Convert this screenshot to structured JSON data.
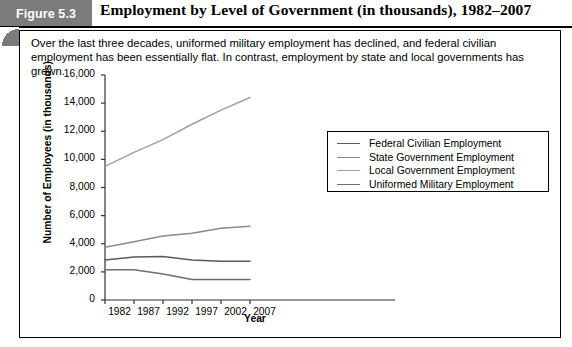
{
  "figure": {
    "tab_label": "Figure 5.3",
    "title": "Employment by Level of Government (in thousands), 1982–2007",
    "caption": "Over the last three decades, uniformed military employment has declined, and federal civilian employment has been essentially flat. In contrast, employment by state and local governments has grown."
  },
  "colors": {
    "tab_background": "#7b7b7b",
    "tab_text": "#ffffff",
    "border": "#000000",
    "series_federal": "#5a5a5a",
    "series_state": "#8a8a8a",
    "series_local": "#a0a0a0",
    "series_military": "#6e6e6e"
  },
  "chart_data": {
    "type": "line",
    "title": "Employment by Level of Government (in thousands), 1982–2007",
    "xlabel": "Year",
    "ylabel": "Number of Employees (in thousands)",
    "categories": [
      1982,
      1987,
      1992,
      1997,
      2002,
      2007
    ],
    "x": [
      1982,
      1987,
      1992,
      1997,
      2002,
      2007
    ],
    "xlim": [
      1982,
      2012
    ],
    "ylim": [
      0,
      16000
    ],
    "ytick_labels": [
      "16,000",
      "14,000",
      "12,000",
      "10,000",
      "8,000",
      "6,000",
      "4,000",
      "2,000",
      "0"
    ],
    "yticks": [
      16000,
      14000,
      12000,
      10000,
      8000,
      6000,
      4000,
      2000,
      0
    ],
    "xtick_labels": [
      "1982",
      "1987",
      "1992",
      "1997",
      "2002",
      "2007"
    ],
    "grid": false,
    "legend_position": "center-right",
    "series": [
      {
        "name": "Federal Civilian Employment",
        "color": "#5a5a5a",
        "values": [
          2850,
          3050,
          3100,
          2850,
          2750,
          2750
        ]
      },
      {
        "name": "State Government Employment",
        "color": "#8a8a8a",
        "values": [
          3750,
          4150,
          4550,
          4750,
          5100,
          5250
        ]
      },
      {
        "name": "Local Government Employment",
        "color": "#a0a0a0",
        "values": [
          9500,
          10500,
          11400,
          12500,
          13500,
          14400
        ]
      },
      {
        "name": "Uniformed Military Employment",
        "color": "#6e6e6e",
        "values": [
          2150,
          2150,
          1850,
          1450,
          1450,
          1450
        ]
      }
    ]
  }
}
